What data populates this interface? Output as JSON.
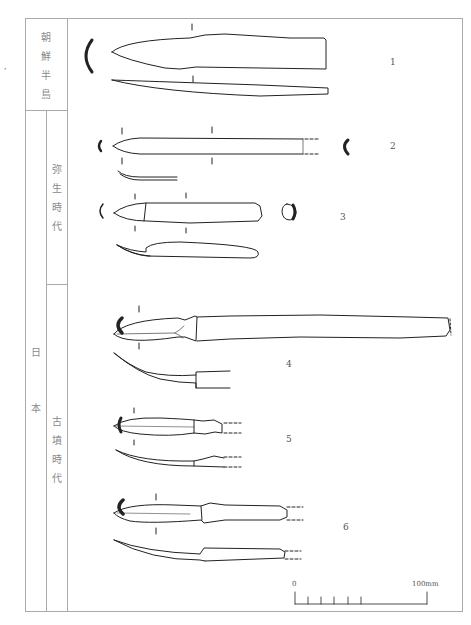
{
  "figure": {
    "type": "archaeological comparison plate",
    "regions": {
      "korea": {
        "label_chars": [
          "朝",
          "鮮",
          "半",
          "島"
        ]
      },
      "japan": {
        "label_chars": [
          "日",
          "本"
        ]
      }
    },
    "periods": {
      "yayoi": {
        "label_chars": [
          "弥",
          "生",
          "時",
          "代"
        ]
      },
      "kofun": {
        "label_chars": [
          "古",
          "墳",
          "時",
          "代"
        ]
      }
    },
    "artifacts": [
      {
        "id": "1",
        "label": "1",
        "region": "korea"
      },
      {
        "id": "2",
        "label": "2",
        "period": "yayoi"
      },
      {
        "id": "3",
        "label": "3",
        "period": "yayoi"
      },
      {
        "id": "4",
        "label": "4",
        "period": "kofun"
      },
      {
        "id": "5",
        "label": "5",
        "period": "kofun"
      },
      {
        "id": "6",
        "label": "6",
        "period": "kofun"
      }
    ],
    "scale_bar": {
      "start_label": "0",
      "end_label": "100mm",
      "ticks": 5
    },
    "stray_mark": "♪"
  }
}
